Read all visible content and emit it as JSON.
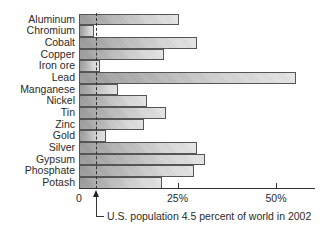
{
  "chart_data": {
    "type": "bar",
    "orientation": "horizontal",
    "title": "",
    "xlabel": "",
    "ylabel": "",
    "categories": [
      "Aluminum",
      "Chromium",
      "Cobalt",
      "Copper",
      "Iron ore",
      "Lead",
      "Manganese",
      "Nickel",
      "Tin",
      "Zinc",
      "Gold",
      "Silver",
      "Gypsum",
      "Phosphate",
      "Potash"
    ],
    "values": [
      25.5,
      3.8,
      30,
      21.5,
      5.4,
      55,
      10,
      17.3,
      22,
      16.5,
      6.8,
      30,
      32,
      29.3,
      21
    ],
    "xlim": [
      0,
      60
    ],
    "x_ticks": [
      {
        "value": 0,
        "label": "0"
      },
      {
        "value": 25,
        "label": "25%"
      },
      {
        "value": 50,
        "label": "50%"
      }
    ],
    "grid": false,
    "reference_line": {
      "value": 4.5,
      "style": "dashed"
    },
    "annotation": "U.S. population 4.5 percent of world in 2002"
  }
}
